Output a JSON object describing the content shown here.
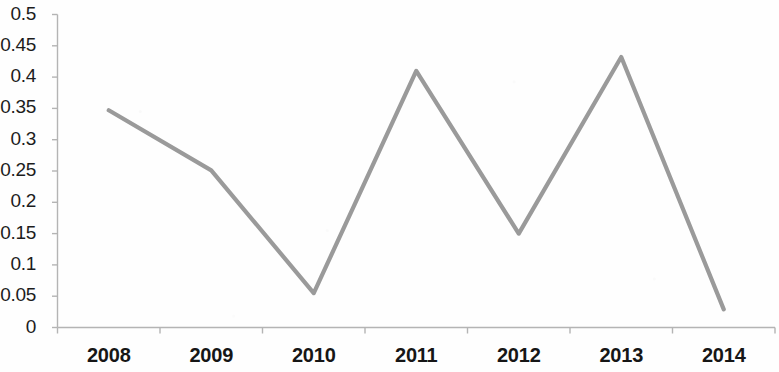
{
  "chart_data": {
    "type": "line",
    "title": "",
    "subtitle": "",
    "xlabel": "",
    "ylabel": "",
    "categories": [
      "2008",
      "2009",
      "2010",
      "2011",
      "2012",
      "2013",
      "2014"
    ],
    "series": [
      {
        "name": "",
        "values": [
          0.347,
          0.251,
          0.055,
          0.41,
          0.15,
          0.432,
          0.029
        ],
        "color": "#9a9a9a"
      }
    ],
    "ylim": [
      0,
      0.5
    ],
    "ytick_values": [
      0,
      0.05,
      0.1,
      0.15,
      0.2,
      0.25,
      0.3,
      0.35,
      0.4,
      0.45,
      0.5
    ],
    "ytick_labels": [
      "0",
      "0.05",
      "0.1",
      "0.15",
      "0.2",
      "0.25",
      "0.3",
      "0.35",
      "0.4",
      "0.45",
      "0.5"
    ],
    "xtick_labels": [
      "2008",
      "2009",
      "2010",
      "2011",
      "2012",
      "2013",
      "2014"
    ],
    "grid": false,
    "legend": false,
    "legend_position": "none",
    "annotations": []
  },
  "axis": {
    "line_color": "#b4b4b4",
    "tick_color": "#b4b4b4",
    "text_color": "#1c1c1c"
  },
  "canvas": {
    "background": "#fefefe",
    "width": 779,
    "height": 372
  }
}
